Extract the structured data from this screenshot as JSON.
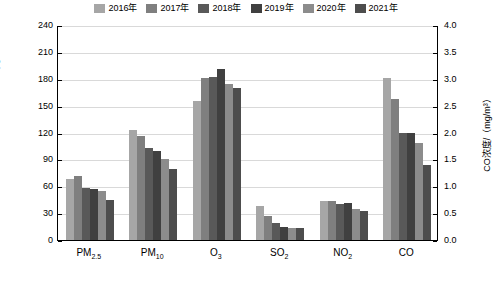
{
  "chart_data": {
    "type": "bar",
    "title": "",
    "xlabel": "",
    "ylabel_left": "污染物浓度（除CO外）/（μg/m³）",
    "ylabel_right": "CO浓度/（mg/m³）",
    "categories": [
      "PM2.5",
      "PM10",
      "O3",
      "SO2",
      "NO2",
      "CO"
    ],
    "category_labels_html": [
      "PM<sub>2.5</sub>",
      "PM<sub>10</sub>",
      "O<sub>3</sub>",
      "SO<sub>2</sub>",
      "NO<sub>2</sub>",
      "CO"
    ],
    "series": [
      {
        "name": "2016年",
        "color": "#a6a6a6",
        "values": [
          68,
          123,
          155,
          38,
          43,
          3.02
        ]
      },
      {
        "name": "2017年",
        "color": "#7f7f7f",
        "values": [
          71,
          116,
          181,
          27,
          43,
          2.63
        ]
      },
      {
        "name": "2018年",
        "color": "#595959",
        "values": [
          58,
          103,
          182,
          19,
          40,
          2.0
        ]
      },
      {
        "name": "2019年",
        "color": "#404040",
        "values": [
          57,
          99,
          191,
          15,
          41,
          2.0
        ]
      },
      {
        "name": "2020年",
        "color": "#8c8c8c",
        "values": [
          55,
          90,
          174,
          13,
          35,
          1.8
        ]
      },
      {
        "name": "2021年",
        "color": "#4d4d4d",
        "values": [
          45,
          79,
          170,
          13,
          32,
          1.4
        ]
      }
    ],
    "ylim_left": [
      0,
      240
    ],
    "ylim_right": [
      0,
      4.0
    ],
    "yticks_left": [
      "0",
      "30",
      "60",
      "90",
      "120",
      "150",
      "180",
      "210",
      "240"
    ],
    "yticks_right": [
      "0.0",
      "0.5",
      "1.0",
      "1.5",
      "2.0",
      "2.5",
      "3.0",
      "3.5",
      "4.0"
    ],
    "grid": true,
    "legend_position": "top"
  }
}
